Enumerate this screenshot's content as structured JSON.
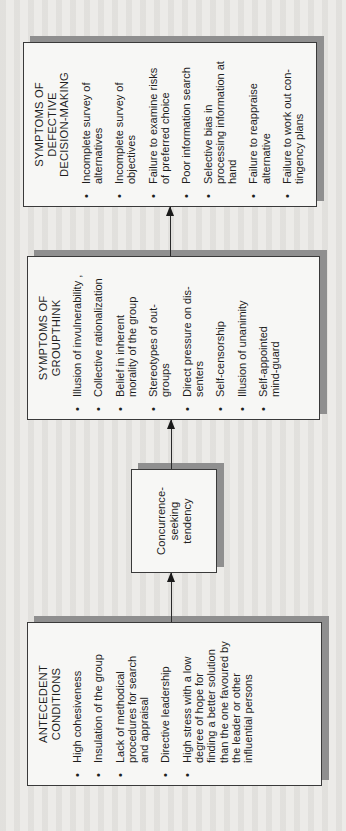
{
  "diagram": {
    "orientation": "rotated-90-counterclockwise",
    "boxes": {
      "antecedent": {
        "title": "ANTECEDENT\nCONDITIONS",
        "items": [
          "High cohesiveness",
          "Insulation of the group",
          "Lack of methodical\nprocedures for search\nand appraisal",
          "Directive leadership",
          "High stress with a low\ndegree of hope for\nfinding a better solution\nthan the one favoured by\nthe leader or other\ninfluential persons"
        ]
      },
      "concurrence": {
        "label": "Concurrence-\nseeking\ntendency"
      },
      "groupthink": {
        "title": "SYMPTOMS OF\nGROUPTHINK",
        "items": [
          "Illusion of invulnerability ,",
          "Collective rationalization",
          "Belief in inherent\nmorality of the group",
          "Stereotypes of out-\ngroups",
          "Direct pressure on dis-\nsenters",
          "Self-censorship",
          "Illusion of unanimity",
          "Self-appointed\nmind-guard"
        ]
      },
      "defective": {
        "title": "SYMPTOMS OF DEFECTIVE\nDECISION-MAKING",
        "items": [
          "Incomplete survey of\nalternatives",
          "Incomplete survey of\nobjectives",
          "Failure to examine risks\nof preferred choice",
          "Poor information search",
          "Selective bias in\nprocessing information at\nhand",
          "Failure to reappraise\nalternative",
          "Failure to work out con-\ntingency plans"
        ]
      }
    },
    "bullet": "•",
    "arrows": [
      {
        "from": "antecedent",
        "to": "concurrence"
      },
      {
        "from": "concurrence",
        "to": "groupthink"
      },
      {
        "from": "groupthink",
        "to": "defective"
      }
    ],
    "colors": {
      "paper": "#ecebe8",
      "box_fill": "#f7f7f5",
      "border": "#3a3a3a",
      "shadow": "#8f8f8f",
      "text": "#1e1e1e"
    }
  }
}
